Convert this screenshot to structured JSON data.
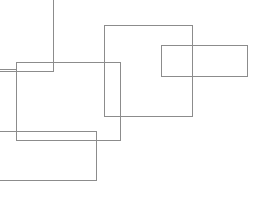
{
  "canvas": {
    "width": 274,
    "height": 224,
    "background_color": "#ffffff",
    "description": "Line drawing of five overlapping axis-aligned rectangle outlines, several clipped by the canvas edges"
  },
  "style": {
    "stroke_color": "#8c8c8c",
    "stroke_width": 1,
    "fill": "none"
  },
  "shapes": [
    {
      "id": "rect-top-left-clipped",
      "name": "top-left-clipped-rectangle",
      "x": -40,
      "y": -30,
      "width": 93,
      "height": 101,
      "stroke": "#8c8c8c"
    },
    {
      "id": "rect-mid-left",
      "name": "mid-left-rectangle",
      "x": 16,
      "y": 62,
      "width": 104,
      "height": 78,
      "stroke": "#8c8c8c"
    },
    {
      "id": "rect-left-edge-clipped",
      "name": "left-edge-clipped-rectangle",
      "x": -60,
      "y": 69,
      "width": 76,
      "height": 62,
      "stroke": "#8c8c8c"
    },
    {
      "id": "rect-large-center",
      "name": "large-center-rectangle",
      "x": 104,
      "y": 25,
      "width": 88,
      "height": 91,
      "stroke": "#8c8c8c"
    },
    {
      "id": "rect-right-wide",
      "name": "right-wide-rectangle",
      "x": 161,
      "y": 45,
      "width": 86,
      "height": 31,
      "stroke": "#8c8c8c"
    },
    {
      "id": "rect-bottom-left",
      "name": "bottom-left-rectangle",
      "x": -50,
      "y": 131,
      "width": 146,
      "height": 49,
      "stroke": "#8c8c8c"
    }
  ]
}
